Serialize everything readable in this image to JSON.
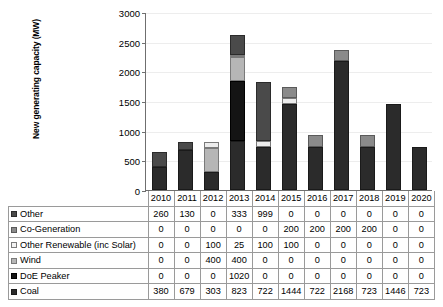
{
  "chart_data": {
    "type": "bar",
    "stacked": true,
    "title": "",
    "xlabel": "",
    "ylabel": "New generating capacity (MW)",
    "ylim": [
      0,
      3000
    ],
    "ytick_labels": [
      "0",
      "500",
      "1000",
      "1500",
      "2000",
      "2500",
      "3000"
    ],
    "ytick_values": [
      0,
      500,
      1000,
      1500,
      2000,
      2500,
      3000
    ],
    "grid": true,
    "legend_position": "table-row-labels",
    "categories": [
      "2010",
      "2011",
      "2012",
      "2013",
      "2014",
      "2015",
      "2016",
      "2017",
      "2018",
      "2019",
      "2020"
    ],
    "series": [
      {
        "name": "Coal",
        "swatch": "sw-coal",
        "seg": "seg-coal",
        "values": [
          380,
          679,
          303,
          823,
          722,
          1444,
          722,
          2168,
          723,
          1446,
          723
        ]
      },
      {
        "name": "DoE Peaker",
        "swatch": "sw-doe",
        "seg": "seg-doe",
        "values": [
          0,
          0,
          0,
          1020,
          0,
          0,
          0,
          0,
          0,
          0,
          0
        ]
      },
      {
        "name": "Wind",
        "swatch": "sw-wind",
        "seg": "seg-wind",
        "values": [
          0,
          0,
          400,
          400,
          0,
          0,
          0,
          0,
          0,
          0,
          0
        ]
      },
      {
        "name": "Other Renewable (inc Solar)",
        "swatch": "sw-renew",
        "seg": "seg-renew",
        "values": [
          0,
          0,
          100,
          25,
          100,
          100,
          0,
          0,
          0,
          0,
          0
        ]
      },
      {
        "name": "Co-Generation",
        "swatch": "sw-cogen",
        "seg": "seg-cogen",
        "values": [
          0,
          0,
          0,
          0,
          0,
          200,
          200,
          200,
          200,
          0,
          0
        ]
      },
      {
        "name": "Other",
        "swatch": "sw-other",
        "seg": "seg-other",
        "values": [
          260,
          130,
          0,
          333,
          999,
          0,
          0,
          0,
          0,
          0,
          0
        ]
      }
    ],
    "table_row_order": [
      "Other",
      "Co-Generation",
      "Other Renewable (inc Solar)",
      "Wind",
      "DoE Peaker",
      "Coal"
    ]
  }
}
